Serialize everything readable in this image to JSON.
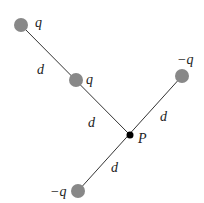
{
  "diagram": {
    "charges": [
      {
        "label": "q",
        "x": 21,
        "y": 25
      },
      {
        "label": "q",
        "x": 76,
        "y": 80
      },
      {
        "label": "−q",
        "x": 182,
        "y": 76
      },
      {
        "label": "−q",
        "x": 78,
        "y": 191
      }
    ],
    "point": {
      "label": "P",
      "x": 130,
      "y": 135
    },
    "distance_labels": [
      "d",
      "d",
      "d",
      "d"
    ],
    "colors": {
      "charge": "#888888",
      "line": "#333333",
      "point": "#000000"
    }
  }
}
